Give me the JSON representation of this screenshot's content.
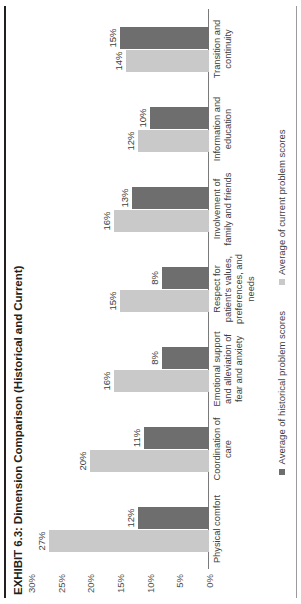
{
  "exhibit": {
    "title": "EXHIBIT 6.3: Dimension Comparison (Historical and Current)"
  },
  "legend": {
    "items": [
      {
        "label": "Average of historical problem scores",
        "color": "#6e6e6e"
      },
      {
        "label": "Average of current problem scores",
        "color": "#c9c9c9"
      }
    ]
  },
  "chart_data": {
    "type": "bar",
    "title": "EXHIBIT 6.3: Dimension Comparison (Historical and Current)",
    "orientation": "vertical",
    "xlabel": "",
    "ylabel": "",
    "ylim": [
      0,
      30
    ],
    "grid": false,
    "legend_position": "bottom",
    "ticks": [
      "0%",
      "5%",
      "10%",
      "15%",
      "20%",
      "25%",
      "30%"
    ],
    "tick_values": [
      0,
      5,
      10,
      15,
      20,
      25,
      30
    ],
    "categories": [
      "Physical comfort",
      "Coordination of care",
      "Emotional support and alleviation of fear and anxiety",
      "Respect for patient's values, preferences, and needs",
      "Involvement of family and friends",
      "Information and education",
      "Transition and continuity"
    ],
    "series": [
      {
        "name": "Average of current problem scores",
        "color": "#c9c9c9",
        "values": [
          27,
          20,
          16,
          15,
          16,
          12,
          14
        ],
        "labels": [
          "27%",
          "20%",
          "16%",
          "15%",
          "16%",
          "12%",
          "14%"
        ]
      },
      {
        "name": "Average of historical problem scores",
        "color": "#6e6e6e",
        "values": [
          12,
          11,
          8,
          8,
          13,
          10,
          15
        ],
        "labels": [
          "12%",
          "11%",
          "8%",
          "8%",
          "13%",
          "10%",
          "15%"
        ]
      }
    ]
  }
}
